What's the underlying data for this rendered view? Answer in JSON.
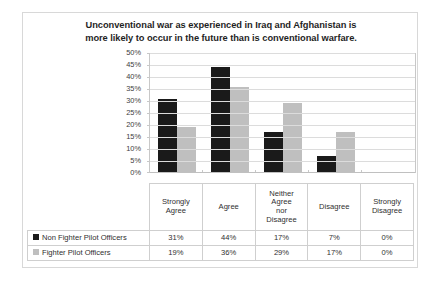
{
  "chart_data": {
    "type": "bar",
    "title": "Unconventional war as experienced in Iraq and Afghanistan is more likely to occur in the future than is conventional warfare.",
    "title_lines": [
      "Unconventional war as experienced in Iraq and Afghanistan is",
      "more likely to occur in the future than is conventional warfare."
    ],
    "xlabel": "",
    "ylabel": "",
    "ylim": [
      0,
      50
    ],
    "ytick_labels": [
      "50%",
      "45%",
      "40%",
      "35%",
      "30%",
      "25%",
      "20%",
      "15%",
      "10%",
      "5%",
      "0%"
    ],
    "ytick_values": [
      50,
      45,
      40,
      35,
      30,
      25,
      20,
      15,
      10,
      5,
      0
    ],
    "grid": true,
    "legend_position": "data-table",
    "categories": [
      "Strongly Agree",
      "Agree",
      "Neither Agree nor Disagree",
      "Disagree",
      "Strongly Disagree"
    ],
    "category_lines": [
      [
        "Strongly",
        "Agree"
      ],
      [
        "Agree"
      ],
      [
        "Neither",
        "Agree",
        "nor",
        "Disagree"
      ],
      [
        "Disagree"
      ],
      [
        "Strongly",
        "Disagree"
      ]
    ],
    "series": [
      {
        "name": "Non Fighter Pilot Officers",
        "color": "#1a1a1a",
        "values": [
          31,
          44,
          17,
          7,
          0
        ],
        "labels": [
          "31%",
          "44%",
          "17%",
          "7%",
          "0%"
        ]
      },
      {
        "name": "Fighter Pilot Officers",
        "color": "#bfbfbf",
        "values": [
          19,
          36,
          29,
          17,
          0
        ],
        "labels": [
          "19%",
          "36%",
          "29%",
          "17%",
          "0%"
        ]
      }
    ]
  }
}
